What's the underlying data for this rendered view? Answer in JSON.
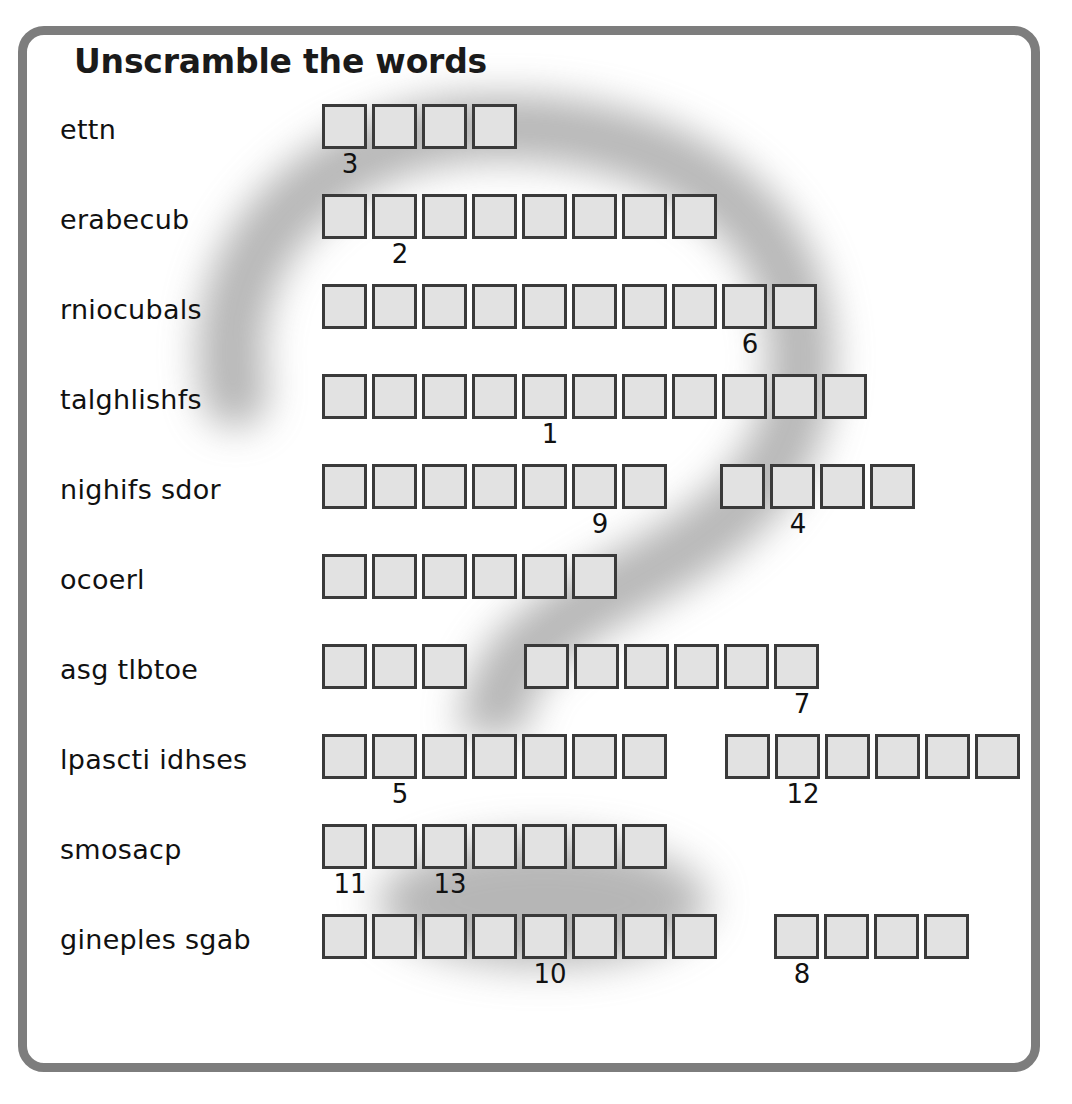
{
  "worksheet": {
    "title": "Unscramble the words",
    "frame_color": "#7d7d7d",
    "box_fill_color": "#e2e2e2",
    "box_border_color": "#3a3a3a",
    "watermark_icon": "question-mark-watermark",
    "rows": [
      {
        "scrambled": "ettn",
        "groups": [
          {
            "length": 4,
            "clues": {
              "0": "3"
            }
          }
        ]
      },
      {
        "scrambled": "erabecub",
        "groups": [
          {
            "length": 8,
            "clues": {
              "1": "2"
            }
          }
        ]
      },
      {
        "scrambled": "rniocubals",
        "groups": [
          {
            "length": 10,
            "clues": {
              "8": "6"
            }
          }
        ]
      },
      {
        "scrambled": "talghlishfs",
        "groups": [
          {
            "length": 11,
            "clues": {
              "4": "1"
            }
          }
        ]
      },
      {
        "scrambled": "nighifs sdor",
        "groups": [
          {
            "length": 7,
            "clues": {
              "5": "9"
            }
          },
          {
            "length": 4,
            "clues": {
              "1": "4"
            },
            "gap": 48
          }
        ]
      },
      {
        "scrambled": "ocoerl",
        "groups": [
          {
            "length": 6,
            "clues": {}
          }
        ]
      },
      {
        "scrambled": "asg tlbtoe",
        "groups": [
          {
            "length": 3,
            "clues": {}
          },
          {
            "length": 6,
            "clues": {
              "5": "7"
            },
            "gap": 52
          }
        ]
      },
      {
        "scrambled": "lpascti idhses",
        "groups": [
          {
            "length": 7,
            "clues": {
              "1": "5"
            }
          },
          {
            "length": 6,
            "clues": {
              "1": "12"
            },
            "gap": 53
          }
        ]
      },
      {
        "scrambled": "smosacp",
        "groups": [
          {
            "length": 7,
            "clues": {
              "0": "11",
              "2": "13"
            }
          }
        ]
      },
      {
        "scrambled": "gineples sgab",
        "groups": [
          {
            "length": 8,
            "clues": {
              "4": "10"
            }
          },
          {
            "length": 4,
            "clues": {
              "0": "8"
            },
            "gap": 52
          }
        ]
      }
    ]
  }
}
